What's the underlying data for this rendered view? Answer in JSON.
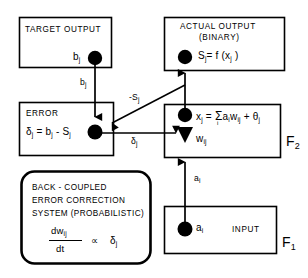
{
  "diagram": {
    "title_semantic": "back-coupled-error-correction-neural-network-diagram",
    "boxes": {
      "target_output": {
        "title": "TARGET  OUTPUT",
        "node_label": "b",
        "node_sub": "j"
      },
      "actual_output": {
        "title_line1": "ACTUAL  OUTPUT",
        "title_line2": "(BINARY)",
        "formula_s": "S",
        "formula_s_sub": "j",
        "formula_eq": "= f (x",
        "formula_x_sub": "j",
        "formula_close": " )"
      },
      "error": {
        "title": "ERROR",
        "f_delta": "δ",
        "f_delta_sub": "j",
        "f_eq": "= b",
        "f_b_sub": "j",
        "f_minus": "- S",
        "f_s_sub": "j"
      },
      "activation": {
        "f_x": "x",
        "f_x_sub": "j",
        "f_eq": "= ",
        "f_sigma": "Σ",
        "f_sigma_sub": "i",
        "f_a": "a",
        "f_a_sub": "i",
        "f_w": "w",
        "f_w_sub": "ij",
        "f_plus": "+ θ",
        "f_theta_sub": "j",
        "weight_label": "w",
        "weight_sub": "ij"
      },
      "input": {
        "title": "INPUT",
        "node_label": "a",
        "node_sub": "i"
      },
      "back_coupled": {
        "line1": "BACK - COUPLED",
        "line2": "ERROR CORRECTION",
        "line3": "SYSTEM (PROBABILISTIC)",
        "frac_numerator": "dw",
        "frac_numerator_sub": "ij",
        "frac_denominator": "dt",
        "proportional": "∝",
        "rhs": "δ",
        "rhs_sub": "j"
      }
    },
    "layers": {
      "f2": "F",
      "f2_sub": "2",
      "f1": "F",
      "f1_sub": "1"
    },
    "edges": {
      "b_j": {
        "label": "b",
        "sub": "j"
      },
      "neg_s_j": {
        "label": "-S",
        "sub": "j"
      },
      "delta_j": {
        "label": "δ",
        "sub": "j"
      },
      "a_i": {
        "label": "a",
        "sub": "i"
      }
    },
    "colors": {
      "stroke": "#000000",
      "fill_node": "#000000",
      "background": "#ffffff"
    }
  }
}
